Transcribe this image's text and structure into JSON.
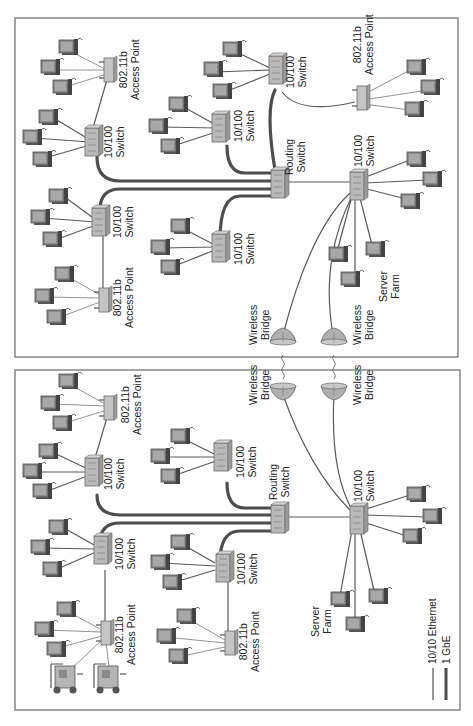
{
  "diagram": {
    "orientation": "rotated-90-clockwise",
    "panels": [
      {
        "id": "top",
        "nodes": {
          "routing_switch": {
            "label_line1": "Routing",
            "label_line2": "Switch"
          },
          "access_switches": [
            {
              "label_line1": "10/100",
              "label_line2": "Switch"
            },
            {
              "label_line1": "10/100",
              "label_line2": "Switch"
            },
            {
              "label_line1": "10/100",
              "label_line2": "Switch"
            },
            {
              "label_line1": "10/100",
              "label_line2": "Switch"
            }
          ],
          "server_switch": {
            "label_line1": "10/100",
            "label_line2": "Switch"
          },
          "access_points": [
            {
              "label_line1": "802.11b",
              "label_line2": "Access Point"
            },
            {
              "label_line1": "802.11b",
              "label_line2": "Access Point"
            },
            {
              "label_line1": "802.11b",
              "label_line2": "Access Point"
            }
          ],
          "server_farm": {
            "label_line1": "Server",
            "label_line2": "Farm"
          },
          "wireless_bridges": [
            {
              "label_line1": "Wireless",
              "label_line2": "Bridge"
            },
            {
              "label_line1": "Wireless",
              "label_line2": "Bridge"
            }
          ]
        }
      },
      {
        "id": "bottom",
        "nodes": {
          "routing_switch": {
            "label_line1": "Routing",
            "label_line2": "Switch"
          },
          "access_switches": [
            {
              "label_line1": "10/100",
              "label_line2": "Switch"
            },
            {
              "label_line1": "10/100",
              "label_line2": "Switch"
            },
            {
              "label_line1": "10/100",
              "label_line2": "Switch"
            },
            {
              "label_line1": "10/100",
              "label_line2": "Switch"
            }
          ],
          "server_switch": {
            "label_line1": "10/100",
            "label_line2": "Switch"
          },
          "access_points": [
            {
              "label_line1": "802.11b",
              "label_line2": "Access Point"
            },
            {
              "label_line1": "802.11b",
              "label_line2": "Access Point"
            },
            {
              "label_line1": "802.11b",
              "label_line2": "Access Point"
            }
          ],
          "server_farm": {
            "label_line1": "Server",
            "label_line2": "Farm"
          },
          "wireless_bridges": [
            {
              "label_line1": "Wireless",
              "label_line2": "Bridge"
            },
            {
              "label_line1": "Wireless",
              "label_line2": "Bridge"
            }
          ]
        }
      }
    ],
    "legend": [
      {
        "label": "10/10 Ethernet",
        "style": "thin"
      },
      {
        "label": "1 GbE",
        "style": "thick"
      }
    ],
    "colors": {
      "gbe_link": "#4d4d4d",
      "ethernet_link": "#5a5a5a",
      "device_fill": "#b9b9b9",
      "border": "#6a6a6a"
    }
  }
}
